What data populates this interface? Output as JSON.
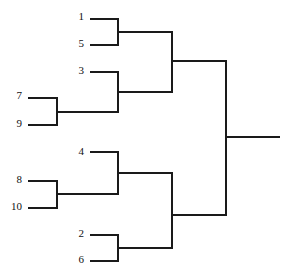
{
  "diagram": {
    "type": "single-elimination-tournament-bracket",
    "orientation": "left-to-right",
    "background_color": "#ffffff",
    "line_color": "#1a1a1a",
    "line_width": 2,
    "text_color": "#111111",
    "total_entrants": 10,
    "rounds": 4
  },
  "seeds": {
    "s1": "1",
    "s5": "5",
    "s3": "3",
    "s7": "7",
    "s9": "9",
    "s4": "4",
    "s8": "8",
    "s10": "10",
    "s2": "2",
    "s6": "6"
  },
  "seed_positions": [
    {
      "key": "s1",
      "label": "1",
      "x": 78,
      "y": 11,
      "line_y": 19,
      "line_x1": 90,
      "line_x2": 118,
      "column": "inner"
    },
    {
      "key": "s5",
      "label": "5",
      "x": 78,
      "y": 38,
      "line_y": 45,
      "line_x1": 90,
      "line_x2": 118,
      "column": "inner"
    },
    {
      "key": "s3",
      "label": "3",
      "x": 78,
      "y": 65,
      "line_y": 72,
      "line_x1": 90,
      "line_x2": 118,
      "column": "inner"
    },
    {
      "key": "s7",
      "label": "7",
      "x": 13,
      "y": 90,
      "line_y": 98,
      "line_x1": 28,
      "line_x2": 57,
      "column": "outer"
    },
    {
      "key": "s9",
      "label": "9",
      "x": 13,
      "y": 118,
      "line_y": 125,
      "line_x1": 28,
      "line_x2": 57,
      "column": "outer"
    },
    {
      "key": "s4",
      "label": "4",
      "x": 78,
      "y": 146,
      "line_y": 152,
      "line_x1": 90,
      "line_x2": 118,
      "column": "inner"
    },
    {
      "key": "s8",
      "label": "8",
      "x": 13,
      "y": 174,
      "line_y": 181,
      "line_x1": 28,
      "line_x2": 57,
      "column": "outer"
    },
    {
      "key": "s10",
      "label": "10",
      "x": 7,
      "y": 201,
      "line_y": 208,
      "line_x1": 28,
      "line_x2": 57,
      "column": "outer"
    },
    {
      "key": "s2",
      "label": "2",
      "x": 78,
      "y": 228,
      "line_y": 235,
      "line_x1": 90,
      "line_x2": 118,
      "column": "inner"
    },
    {
      "key": "s6",
      "label": "6",
      "x": 78,
      "y": 254,
      "line_y": 261,
      "line_x1": 90,
      "line_x2": 118,
      "column": "inner"
    }
  ],
  "matches": [
    {
      "name": "match-1v5",
      "round": 1,
      "players": [
        "1",
        "5"
      ],
      "bracket_x": 118,
      "y_top": 19,
      "y_bottom": 45,
      "out_y": 32,
      "out_x": 172
    },
    {
      "name": "match-7v9",
      "round": 1,
      "players": [
        "7",
        "9"
      ],
      "bracket_x": 57,
      "y_top": 98,
      "y_bottom": 125,
      "out_y": 112,
      "out_x": 118
    },
    {
      "name": "match-3v79",
      "round": 2,
      "players": [
        "3",
        "7/9 winner"
      ],
      "bracket_x": 118,
      "y_top": 72,
      "y_bottom": 112,
      "out_y": 92,
      "out_x": 172
    },
    {
      "name": "match-upper-semifinal",
      "round": 3,
      "players": [
        "1/5 winner",
        "3 bracket winner"
      ],
      "bracket_x": 172,
      "y_top": 32,
      "y_bottom": 92,
      "out_y": 61,
      "out_x": 226
    },
    {
      "name": "match-8v10",
      "round": 1,
      "players": [
        "8",
        "10"
      ],
      "bracket_x": 57,
      "y_top": 181,
      "y_bottom": 208,
      "out_y": 194,
      "out_x": 118
    },
    {
      "name": "match-4v810",
      "round": 2,
      "players": [
        "4",
        "8/10 winner"
      ],
      "bracket_x": 118,
      "y_top": 152,
      "y_bottom": 194,
      "out_y": 173,
      "out_x": 172
    },
    {
      "name": "match-2v6",
      "round": 1,
      "players": [
        "2",
        "6"
      ],
      "bracket_x": 118,
      "y_top": 235,
      "y_bottom": 261,
      "out_y": 248,
      "out_x": 172
    },
    {
      "name": "match-lower-semifinal",
      "round": 3,
      "players": [
        "4 bracket winner",
        "2/6 winner"
      ],
      "bracket_x": 172,
      "y_top": 173,
      "y_bottom": 248,
      "out_y": 215,
      "out_x": 226
    },
    {
      "name": "match-final",
      "round": 4,
      "players": [
        "upper semifinal winner",
        "lower semifinal winner"
      ],
      "bracket_x": 226,
      "y_top": 61,
      "y_bottom": 215,
      "out_y": 137,
      "out_x": 280
    }
  ],
  "champion_line": {
    "name": "champion-output-line",
    "x1": 226,
    "x2": 280,
    "y": 137,
    "label": ""
  }
}
